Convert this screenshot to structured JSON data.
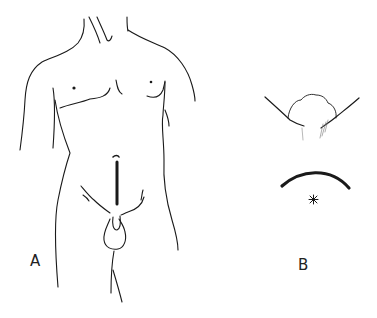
{
  "figure": {
    "panels": [
      {
        "id": "A",
        "label": "A",
        "description": "Male torso line drawing with lower midline abdominal incision"
      },
      {
        "id": "B",
        "label": "B",
        "description": "Close-up of curved incision with marked point"
      }
    ]
  },
  "colors": {
    "ink": "#1a1a1a",
    "background": "#ffffff"
  }
}
